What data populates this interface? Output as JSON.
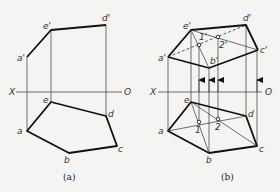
{
  "figures": [
    {
      "id": "a",
      "caption": "(a)",
      "axis": {
        "left_label": "X",
        "right_label": "O"
      },
      "front_labels": {
        "a": "a'",
        "e": "e'",
        "d": "d'"
      },
      "top_labels": {
        "a": "a",
        "b": "b",
        "c": "c",
        "d": "d",
        "e": "e"
      }
    },
    {
      "id": "b",
      "caption": "(b)",
      "axis": {
        "left_label": "X",
        "right_label": "O"
      },
      "front_labels": {
        "a": "a'",
        "b": "b'",
        "c": "c'",
        "d": "d'",
        "e": "e'",
        "p1": "1'",
        "p2": "2'"
      },
      "top_labels": {
        "a": "a",
        "b": "b",
        "c": "c",
        "d": "d",
        "e": "e",
        "p1": "1",
        "p2": "2"
      }
    }
  ],
  "colors": {
    "line": "#111111",
    "thin_line": "#333333",
    "background": "#f4f4f2"
  }
}
